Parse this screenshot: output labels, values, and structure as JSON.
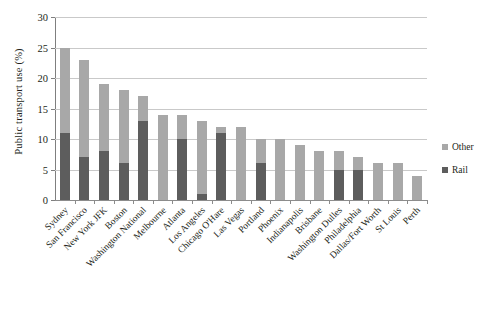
{
  "chart_data": {
    "type": "bar",
    "subtype": "stacked-vertical",
    "title": "",
    "xlabel": "",
    "ylabel": "Public transport use (%)",
    "ylim": [
      0,
      30
    ],
    "yticks": [
      0,
      5,
      10,
      15,
      20,
      25,
      30
    ],
    "ytick_labels": [
      "0",
      "5",
      "10",
      "15",
      "20",
      "25",
      "30"
    ],
    "grid": "horizontal",
    "legend_position": "right",
    "categories": [
      "Sydney",
      "San Francisco",
      "New York JFK",
      "Boston",
      "Washington National",
      "Melbourne",
      "Atlanta",
      "Los Angeles",
      "Chicago O'Hare",
      "Las Vegas",
      "Portland",
      "Phoenix",
      "Indianapolis",
      "Brisbane",
      "Washington Dulles",
      "Philadelphia",
      "Dallas/Fort Worth",
      "St Louis",
      "Perth"
    ],
    "series": [
      {
        "name": "Rail",
        "color": "#5d5d5d",
        "values": [
          11,
          7,
          8,
          6,
          13,
          0,
          10,
          1,
          11,
          0,
          6,
          0,
          0,
          0,
          5,
          5,
          0,
          0,
          0
        ]
      },
      {
        "name": "Other",
        "color": "#a8a8a8",
        "values": [
          14,
          16,
          11,
          12,
          4,
          14,
          4,
          12,
          1,
          12,
          4,
          10,
          9,
          8,
          3,
          2,
          6,
          6,
          4
        ]
      }
    ],
    "totals": [
      25,
      23,
      19,
      18,
      17,
      14,
      14,
      13,
      12,
      12,
      10,
      10,
      9,
      8,
      8,
      7,
      6,
      6,
      4
    ]
  },
  "legend": {
    "items": [
      {
        "label": "Other",
        "color": "#a8a8a8"
      },
      {
        "label": "Rail",
        "color": "#5d5d5d"
      }
    ]
  }
}
